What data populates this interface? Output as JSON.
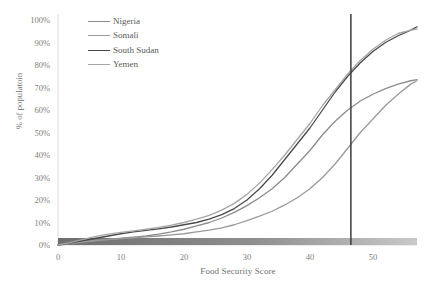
{
  "chart_data": {
    "type": "line",
    "title": "",
    "xlabel": "Food Security Score",
    "ylabel": "% of populatoin",
    "xlim": [
      0,
      57
    ],
    "ylim": [
      0,
      1.0
    ],
    "grid": false,
    "legend_position": "top-left-inside",
    "x_ticks": [
      0,
      10,
      20,
      30,
      40,
      50
    ],
    "x_tick_labels": [
      "0",
      "10",
      "20",
      "30",
      "40",
      "50"
    ],
    "y_ticks": [
      0,
      0.1,
      0.2,
      0.3,
      0.4,
      0.5,
      0.6,
      0.7,
      0.8,
      0.9,
      1.0
    ],
    "y_tick_labels": [
      "0%",
      "10%",
      "20%",
      "30%",
      "40%",
      "50%",
      "60%",
      "70%",
      "80%",
      "90%",
      "100%"
    ],
    "annotations": [
      {
        "name": "threshold-line",
        "type": "vline",
        "x": 46.5,
        "color": "#3b3b3b"
      },
      {
        "name": "severity-gradient-band",
        "type": "hband",
        "y": 0.0,
        "x_start": 0,
        "x_end": 57,
        "color_start": "#6e6e6e",
        "color_end": "#c9c9c9"
      }
    ],
    "series": [
      {
        "name": "Nigeria",
        "color": "#8c8c8c",
        "x": [
          0,
          2,
          4,
          6,
          8,
          10,
          12,
          14,
          16,
          18,
          20,
          22,
          24,
          26,
          28,
          30,
          32,
          34,
          36,
          38,
          40,
          42,
          44,
          46,
          48,
          50,
          52,
          54,
          56,
          57
        ],
        "values": [
          0.0,
          0.005,
          0.012,
          0.02,
          0.025,
          0.03,
          0.035,
          0.04,
          0.048,
          0.058,
          0.07,
          0.085,
          0.1,
          0.12,
          0.145,
          0.175,
          0.21,
          0.25,
          0.3,
          0.36,
          0.42,
          0.49,
          0.55,
          0.6,
          0.64,
          0.67,
          0.695,
          0.715,
          0.73,
          0.735
        ]
      },
      {
        "name": "Somali",
        "color": "#9a9a9a",
        "x": [
          0,
          2,
          4,
          6,
          8,
          10,
          12,
          14,
          16,
          18,
          20,
          22,
          24,
          26,
          28,
          30,
          32,
          34,
          36,
          38,
          40,
          42,
          44,
          46,
          48,
          50,
          52,
          54,
          56,
          57
        ],
        "values": [
          0.0,
          0.008,
          0.015,
          0.02,
          0.024,
          0.028,
          0.032,
          0.036,
          0.04,
          0.045,
          0.05,
          0.058,
          0.066,
          0.076,
          0.09,
          0.108,
          0.128,
          0.15,
          0.178,
          0.21,
          0.25,
          0.3,
          0.36,
          0.43,
          0.5,
          0.56,
          0.62,
          0.67,
          0.715,
          0.73
        ]
      },
      {
        "name": "South Sudan",
        "color": "#4a4a4a",
        "x": [
          0,
          2,
          4,
          6,
          8,
          10,
          12,
          14,
          16,
          18,
          20,
          22,
          24,
          26,
          28,
          30,
          32,
          34,
          36,
          38,
          40,
          42,
          44,
          46,
          48,
          50,
          52,
          54,
          56,
          57
        ],
        "values": [
          0.0,
          0.01,
          0.02,
          0.03,
          0.04,
          0.05,
          0.058,
          0.065,
          0.072,
          0.08,
          0.09,
          0.1,
          0.115,
          0.135,
          0.162,
          0.2,
          0.25,
          0.31,
          0.38,
          0.45,
          0.52,
          0.6,
          0.68,
          0.75,
          0.81,
          0.86,
          0.9,
          0.93,
          0.955,
          0.97
        ]
      },
      {
        "name": "Yemen",
        "color": "#a6a6a6",
        "x": [
          0,
          2,
          4,
          6,
          8,
          10,
          12,
          14,
          16,
          18,
          20,
          22,
          24,
          26,
          28,
          30,
          32,
          34,
          36,
          38,
          40,
          42,
          44,
          46,
          48,
          50,
          52,
          54,
          56,
          57
        ],
        "values": [
          0.0,
          0.012,
          0.025,
          0.038,
          0.048,
          0.056,
          0.063,
          0.07,
          0.078,
          0.088,
          0.1,
          0.115,
          0.132,
          0.155,
          0.185,
          0.225,
          0.275,
          0.335,
          0.4,
          0.47,
          0.54,
          0.62,
          0.69,
          0.76,
          0.82,
          0.87,
          0.91,
          0.94,
          0.955,
          0.96
        ]
      }
    ]
  },
  "legend": {
    "items": [
      {
        "label": "Nigeria",
        "color": "#8c8c8c"
      },
      {
        "label": "Somali",
        "color": "#9a9a9a"
      },
      {
        "label": "South Sudan",
        "color": "#4a4a4a"
      },
      {
        "label": "Yemen",
        "color": "#a6a6a6"
      }
    ]
  },
  "axes": {
    "axis_line_color": "#d9d9d9"
  }
}
